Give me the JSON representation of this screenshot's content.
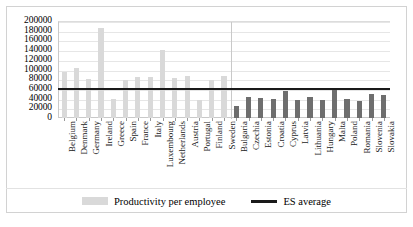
{
  "chart_data": {
    "type": "bar",
    "title": "",
    "xlabel": "",
    "ylabel": "",
    "ylim": [
      0,
      200000
    ],
    "ytick_step": 20000,
    "grid": true,
    "legend_position": "bottom",
    "categories": [
      "Belgium",
      "Denmark",
      "Germany",
      "Ireland",
      "Greece",
      "Spain",
      "France",
      "Italy",
      "Luxembourg",
      "Netherlands",
      "Austria",
      "Portugal",
      "Finland",
      "Sweden",
      "Bulgaria",
      "Czechia",
      "Estonia",
      "Croatia",
      "Cyprus",
      "Latvia",
      "Lithuania",
      "Hungary",
      "Malta",
      "Poland",
      "Romania",
      "Slovenia",
      "Slovakia"
    ],
    "series": [
      {
        "name": "Productivity per employee",
        "color": "#d9d9d9",
        "values": [
          94000,
          104000,
          80000,
          186000,
          40000,
          78000,
          84000,
          84000,
          140000,
          82000,
          86000,
          38000,
          78000,
          86000,
          24000,
          44000,
          42000,
          39000,
          55000,
          37000,
          44000,
          37000,
          62000,
          40000,
          36000,
          50000,
          47000
        ]
      }
    ],
    "reference_line": {
      "name": "ES average",
      "color": "#1a1a1a",
      "value": 62000
    },
    "ytick_labels": [
      "200000",
      "180000",
      "160000",
      "140000",
      "120000",
      "100000",
      "80000",
      "60000",
      "40000",
      "20000",
      "0"
    ],
    "group_divider_after_category": "Sweden",
    "eu15_bar_color": "#d9d9d9",
    "other_bar_color": "#6e6e6e"
  },
  "legend": {
    "bar_label": "Productivity per employee",
    "line_label": "ES average"
  }
}
